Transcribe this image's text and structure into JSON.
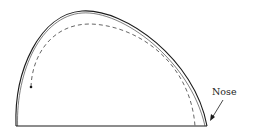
{
  "diagram": {
    "labels": {
      "nose": "Nose"
    },
    "elements": [
      {
        "name": "outer-profile",
        "style": "solid double line"
      },
      {
        "name": "inner-path",
        "style": "dashed",
        "start_marker": "dot"
      },
      {
        "name": "baseline",
        "style": "solid"
      },
      {
        "name": "nose-pointer",
        "style": "arrow",
        "points_to": "nose"
      }
    ],
    "colors": {
      "stroke": "#1a1a1a",
      "dashed": "#555555",
      "background": "#ffffff"
    }
  }
}
